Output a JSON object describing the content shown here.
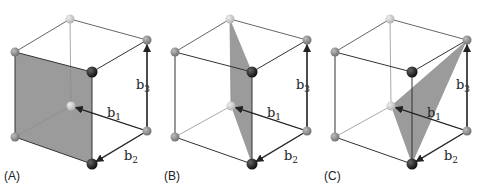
{
  "figure": {
    "colors": {
      "plane": "#8a8a8a",
      "edge_front": "#333333",
      "edge_back": "#aaaaaa",
      "vertex_light": "#c9c9c9",
      "vertex_mid": "#8e8e8e",
      "vertex_dark": "#1a1a1a",
      "arrow": "#222222"
    },
    "vector_labels": {
      "b1": {
        "base": "b",
        "sub": "1"
      },
      "b2": {
        "base": "b",
        "sub": "2"
      },
      "b3": {
        "base": "b",
        "sub": "3"
      }
    },
    "panels": [
      {
        "id": "A",
        "label": "(A)",
        "plane": "face",
        "plane_vertices": [
          "TFL",
          "TFR",
          "BFR",
          "BFL"
        ]
      },
      {
        "id": "B",
        "label": "(B)",
        "plane": "diagonal-rectangle",
        "plane_vertices": [
          "TBL",
          "TFR",
          "BFR",
          "BBL"
        ]
      },
      {
        "id": "C",
        "label": "(C)",
        "plane": "triangle",
        "plane_vertices": [
          "BBL",
          "TBR",
          "BFR"
        ]
      }
    ]
  }
}
